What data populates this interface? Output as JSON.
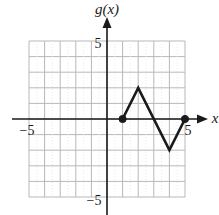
{
  "chart_data": {
    "type": "line",
    "title": "",
    "xlabel": "x",
    "ylabel": "g(x)",
    "xlim": [
      -5,
      5
    ],
    "ylim": [
      -5,
      5
    ],
    "grid": true,
    "grid_step": 1,
    "tick_labels": {
      "x": [
        {
          "value": -5,
          "label": "−5"
        },
        {
          "value": 5,
          "label": "5"
        }
      ],
      "y": [
        {
          "value": 5,
          "label": "5"
        },
        {
          "value": -5,
          "label": "−5"
        }
      ]
    },
    "series": [
      {
        "name": "g(x)",
        "x": [
          1,
          2,
          4,
          5
        ],
        "y": [
          0,
          2,
          -2,
          0
        ],
        "endpoints": [
          {
            "x": 1,
            "y": 0,
            "style": "closed"
          },
          {
            "x": 5,
            "y": 0,
            "style": "closed"
          }
        ]
      }
    ],
    "legend": null
  },
  "labels": {
    "y_axis": "g(x)",
    "x_axis": "x",
    "x_min": "−5",
    "x_max": "5",
    "y_max": "5",
    "y_min": "−5"
  },
  "colors": {
    "grid": "#b8b8b8",
    "axis": "#1a1a1a",
    "curve": "#1a1a1a"
  }
}
